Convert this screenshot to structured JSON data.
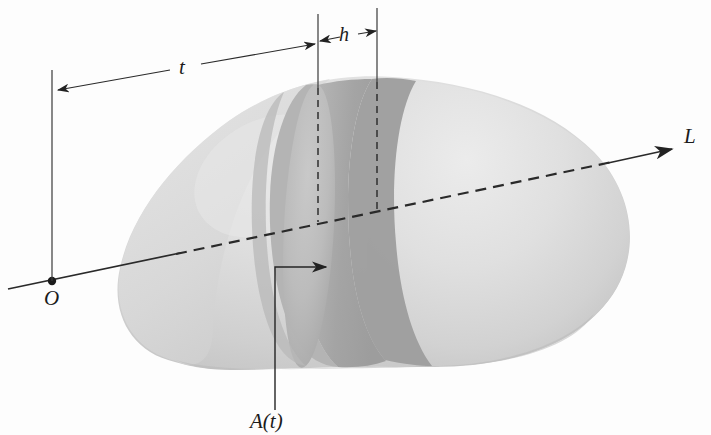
{
  "figure": {
    "kind": "calculus-cross-section-diagram",
    "caption_present": false,
    "background_color": "#fdfdfd",
    "ink_color": "#2a2a2a"
  },
  "labels": {
    "distance_t": "t",
    "thickness_h": "h",
    "axis_line": "L",
    "origin": "O",
    "cross_section_area": "A(t)"
  },
  "solid": {
    "name": "kidney-shaped-solid",
    "fill_light": "#dcdcdc",
    "fill_mid": "#c6c6c6",
    "fill_dark": "#a9a9a9",
    "fill_darkest": "#9a9a9a",
    "highlight": "#e9e9e9"
  },
  "geometry": {
    "origin_point": {
      "x": 52,
      "y": 281
    },
    "axis_start": {
      "x": 8,
      "y": 289
    },
    "axis_end": {
      "x": 676,
      "y": 148
    },
    "vertical_at_origin": {
      "x": 52,
      "y_top": 70,
      "y_bottom": 281
    },
    "slab_left_guide_x": 318,
    "slab_right_guide_x": 377,
    "t_dimension": {
      "x1": 55,
      "y1": 92,
      "x2": 317,
      "y2": 45
    },
    "h_dimension": {
      "x1": 318,
      "y1": 41,
      "x2": 377,
      "y2": 31
    },
    "leader_At": {
      "x_text": 252,
      "y_text": 424,
      "x_corner": 275,
      "y_corner": 267,
      "x_arrow": 330,
      "y_arrow": 267
    }
  },
  "annotations": {
    "t_description": "distance from origin O along line L to the near face of the slab",
    "h_description": "thickness of the thin slab",
    "A_description": "area of the cross-section at distance t"
  }
}
